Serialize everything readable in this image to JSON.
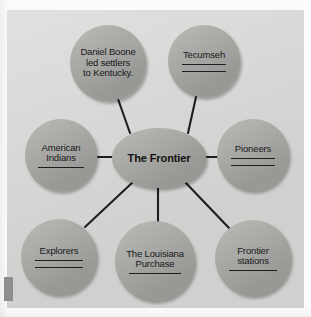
{
  "diagram": {
    "type": "concept-web",
    "center": {
      "id": "center",
      "label": "The Frontier",
      "shape": "ellipse",
      "cx": 159,
      "cy": 158,
      "rx": 47,
      "ry": 30,
      "bold": true,
      "blanks": 0
    },
    "nodes": [
      {
        "id": "daniel-boone",
        "label": "Daniel Boone\nled settlers\nto Kentucky.",
        "shape": "circle",
        "cx": 108,
        "cy": 63,
        "r": 38,
        "blanks": 0,
        "blank_width": 0
      },
      {
        "id": "tecumseh",
        "label": "Tecumseh",
        "shape": "circle",
        "cx": 204,
        "cy": 61,
        "r": 36,
        "blanks": 2,
        "blank_width": 44
      },
      {
        "id": "american-indians",
        "label": "American\nIndians",
        "shape": "circle",
        "cx": 61,
        "cy": 155,
        "r": 36,
        "blanks": 1,
        "blank_width": 46
      },
      {
        "id": "pioneers",
        "label": "Pioneers",
        "shape": "circle",
        "cx": 253,
        "cy": 155,
        "r": 36,
        "blanks": 2,
        "blank_width": 44
      },
      {
        "id": "explorers",
        "label": "Explorers",
        "shape": "circle",
        "cx": 59,
        "cy": 257,
        "r": 38,
        "blanks": 2,
        "blank_width": 48
      },
      {
        "id": "louisiana-purchase",
        "label": "The Louisiana\nPurchase",
        "shape": "circle",
        "cx": 155,
        "cy": 261,
        "r": 40,
        "blanks": 1,
        "blank_width": 52
      },
      {
        "id": "frontier-stations",
        "label": "Frontier\nstations",
        "shape": "circle",
        "cx": 253,
        "cy": 258,
        "r": 38,
        "blanks": 1,
        "blank_width": 48
      }
    ],
    "links": [
      {
        "id": "link-daniel-boone",
        "from": "center",
        "to": "daniel-boone",
        "x1": 130,
        "y1": 133,
        "x2": 118,
        "y2": 99
      },
      {
        "id": "link-tecumseh",
        "from": "center",
        "to": "tecumseh",
        "x1": 188,
        "y1": 133,
        "x2": 196,
        "y2": 97
      },
      {
        "id": "link-american-indians",
        "from": "center",
        "to": "american-indians",
        "x1": 98,
        "y1": 157,
        "x2": 112,
        "y2": 157
      },
      {
        "id": "link-pioneers",
        "from": "center",
        "to": "pioneers",
        "x1": 207,
        "y1": 157,
        "x2": 218,
        "y2": 157
      },
      {
        "id": "link-explorers",
        "from": "center",
        "to": "explorers",
        "x1": 133,
        "y1": 182,
        "x2": 85,
        "y2": 227
      },
      {
        "id": "link-louisiana",
        "from": "center",
        "to": "louisiana-purchase",
        "x1": 158,
        "y1": 188,
        "x2": 158,
        "y2": 222
      },
      {
        "id": "link-frontier-stations",
        "from": "center",
        "to": "frontier-stations",
        "x1": 185,
        "y1": 182,
        "x2": 229,
        "y2": 228
      }
    ],
    "colors": {
      "panel": "#d9d9d7",
      "node_fill": "#a9a9a6",
      "line": "#1d1e20",
      "text": "#17181a",
      "page": "#fbfbfb",
      "edge_mark": "#8e8e8e"
    }
  }
}
